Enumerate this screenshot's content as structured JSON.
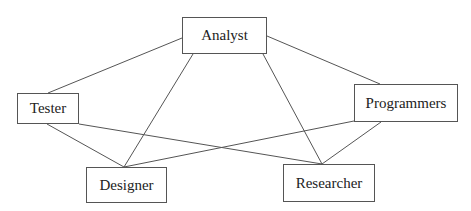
{
  "diagram": {
    "type": "network",
    "colors": {
      "line": "#555555",
      "text": "#222222",
      "background": "#ffffff"
    },
    "nodes": [
      {
        "id": "analyst",
        "label": "Analyst",
        "x": 182,
        "y": 17,
        "w": 85,
        "h": 37
      },
      {
        "id": "tester",
        "label": "Tester",
        "x": 17,
        "y": 93,
        "w": 62,
        "h": 31
      },
      {
        "id": "programmers",
        "label": "Programmers",
        "x": 354,
        "y": 84,
        "w": 104,
        "h": 38
      },
      {
        "id": "designer",
        "label": "Designer",
        "x": 86,
        "y": 167,
        "w": 81,
        "h": 36
      },
      {
        "id": "researcher",
        "label": "Researcher",
        "x": 283,
        "y": 164,
        "w": 92,
        "h": 38
      }
    ],
    "edges": [
      {
        "from": "analyst",
        "to": "tester",
        "x1": 182,
        "y1": 38,
        "x2": 48,
        "y2": 93
      },
      {
        "from": "analyst",
        "to": "programmers",
        "x1": 267,
        "y1": 36,
        "x2": 380,
        "y2": 84
      },
      {
        "from": "analyst",
        "to": "designer",
        "x1": 193,
        "y1": 54,
        "x2": 124,
        "y2": 167
      },
      {
        "from": "analyst",
        "to": "researcher",
        "x1": 263,
        "y1": 54,
        "x2": 322,
        "y2": 164
      },
      {
        "from": "tester",
        "to": "designer",
        "x1": 47,
        "y1": 124,
        "x2": 124,
        "y2": 167
      },
      {
        "from": "tester",
        "to": "researcher",
        "x1": 79,
        "y1": 124,
        "x2": 322,
        "y2": 164
      },
      {
        "from": "programmers",
        "to": "designer",
        "x1": 354,
        "y1": 121,
        "x2": 124,
        "y2": 167
      },
      {
        "from": "programmers",
        "to": "researcher",
        "x1": 381,
        "y1": 122,
        "x2": 322,
        "y2": 164
      }
    ]
  }
}
